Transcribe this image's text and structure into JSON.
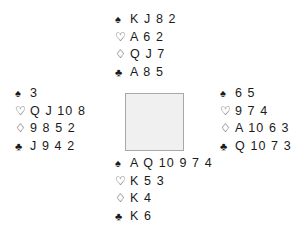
{
  "diagram": {
    "type": "bridge-hand-diagram",
    "background_color": "#ffffff",
    "text_color": "#1a1a1a",
    "center_square": {
      "fill_color": "#f0f0f0",
      "border_color": "#a8a8a8"
    },
    "suit_glyphs": {
      "spade": "♠",
      "heart": "♡",
      "diamond": "♢",
      "club": "♣"
    },
    "hands": {
      "north": {
        "spades": "K J 8 2",
        "hearts": "A 6 2",
        "diamonds": "Q J 7",
        "clubs": "A 8 5"
      },
      "west": {
        "spades": "3",
        "hearts": "Q J 10 8",
        "diamonds": "9 8 5 2",
        "clubs": "J 9 4 2"
      },
      "east": {
        "spades": "6 5",
        "hearts": "9 7 4",
        "diamonds": "A 10 6 3",
        "clubs": "Q 10 7 3"
      },
      "south": {
        "spades": "A Q 10 9 7 4",
        "hearts": "K 5 3",
        "diamonds": "K 4",
        "clubs": "K 6"
      }
    }
  }
}
